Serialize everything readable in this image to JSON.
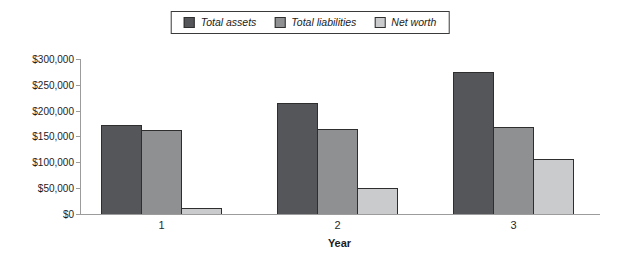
{
  "chart_data": {
    "type": "bar",
    "title": "",
    "xlabel": "Year",
    "ylabel": "",
    "categories": [
      "1",
      "2",
      "3"
    ],
    "series": [
      {
        "name": "Total assets",
        "color": "#54565a",
        "values": [
          173000,
          215000,
          275000
        ]
      },
      {
        "name": "Total liabilities",
        "color": "#8e9092",
        "values": [
          162000,
          165000,
          168000
        ]
      },
      {
        "name": "Net worth",
        "color": "#c9cbcd",
        "values": [
          11000,
          50000,
          107000
        ]
      }
    ],
    "y_axis": {
      "min": 0,
      "max": 300000,
      "step": 50000,
      "ticks": [
        {
          "value": 0,
          "label": "$0"
        },
        {
          "value": 50000,
          "label": "$50,000"
        },
        {
          "value": 100000,
          "label": "$100,000"
        },
        {
          "value": 150000,
          "label": "$150,000"
        },
        {
          "value": 200000,
          "label": "$200,000"
        },
        {
          "value": 250000,
          "label": "$250,000"
        },
        {
          "value": 300000,
          "label": "$300,000"
        }
      ]
    },
    "legend_position": "top-center",
    "grid": false,
    "bar_outline_color": "#2e2e2e",
    "axis_color": "#9c9c9c"
  }
}
